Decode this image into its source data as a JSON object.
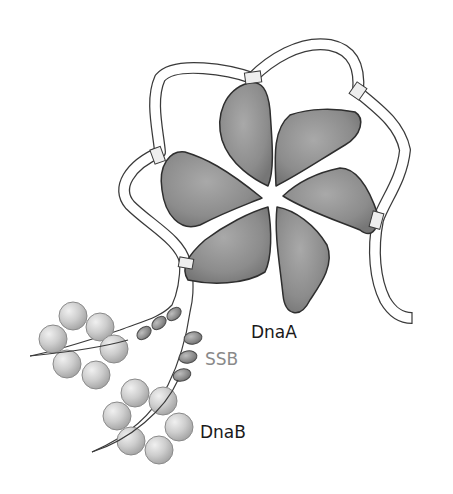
{
  "figure": {
    "labels": {
      "dnaa": "DnaA",
      "ssb": "SSB",
      "dnab": "DnaB"
    },
    "colors": {
      "dnaa_fill": "#8a8a8a",
      "dnaa_stroke": "#2e2e2e",
      "dna_fill": "#ffffff",
      "dna_stroke": "#3a3a3a",
      "dna_contact": "#eeeeee",
      "dnab_fill": "#c8c8c8",
      "ssb_fill": "#8e8e8e",
      "ssb_label": "#8a8a8a",
      "text": "#1a1a1a"
    },
    "components": {
      "dnaa_subunits": 6,
      "dnab_rings": 2,
      "dnab_spheres_per_ring": 6,
      "ssb_upper_strand_count": 3,
      "ssb_lower_strand_count": 3
    }
  }
}
